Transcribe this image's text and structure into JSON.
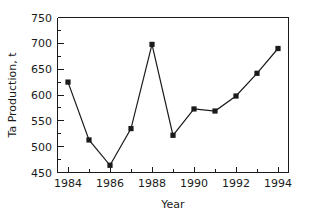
{
  "chart_data": {
    "type": "line",
    "title": "",
    "subtitle": "",
    "xlabel": "Year",
    "ylabel": "Ta Production, t",
    "x": [
      1984,
      1985,
      1986,
      1987,
      1988,
      1989,
      1990,
      1991,
      1992,
      1993,
      1994
    ],
    "values": [
      625,
      513,
      464,
      535,
      698,
      522,
      573,
      569,
      598,
      642,
      690
    ],
    "series": [
      {
        "name": "Ta Production",
        "values": [
          625,
          513,
          464,
          535,
          698,
          522,
          573,
          569,
          598,
          642,
          690
        ]
      }
    ],
    "xlim": [
      1983.5,
      1994.5
    ],
    "ylim": [
      450,
      750
    ],
    "ytick_labels": [
      "450",
      "500",
      "550",
      "600",
      "650",
      "700",
      "750"
    ],
    "ytick_values": [
      450,
      500,
      550,
      600,
      650,
      700,
      750
    ],
    "xtick_labels": [
      "1984",
      "1986",
      "1988",
      "1990",
      "1992",
      "1994"
    ],
    "xtick_values": [
      1984,
      1986,
      1988,
      1990,
      1992,
      1994
    ],
    "xtick_minor_values": [
      1985,
      1987,
      1989,
      1991,
      1993
    ],
    "ytick_minor_values": [
      475,
      525,
      575,
      625,
      675,
      725
    ],
    "grid": false,
    "legend": null,
    "legend_position": "none",
    "marker_style": "square",
    "line_color": "#1a1a1a",
    "marker_color": "#1a1a1a",
    "background_color": "#ffffff",
    "annotations": []
  }
}
